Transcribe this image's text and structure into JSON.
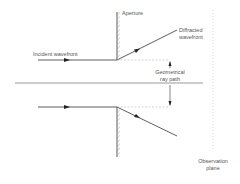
{
  "diagram": {
    "labels": {
      "aperture": "Aperture",
      "incident_wavefront": "Incident wavefront",
      "diffracted_line1": "Diffracted",
      "diffracted_line2": "wavefront",
      "geometrical_line1": "Geometrical",
      "geometrical_line2": "ray path",
      "observation_line1": "Observation",
      "observation_line2": "plane"
    },
    "colors": {
      "line": "#333333",
      "axis": "#999999",
      "dashed": "#bbbbbb",
      "text": "#555555"
    }
  }
}
